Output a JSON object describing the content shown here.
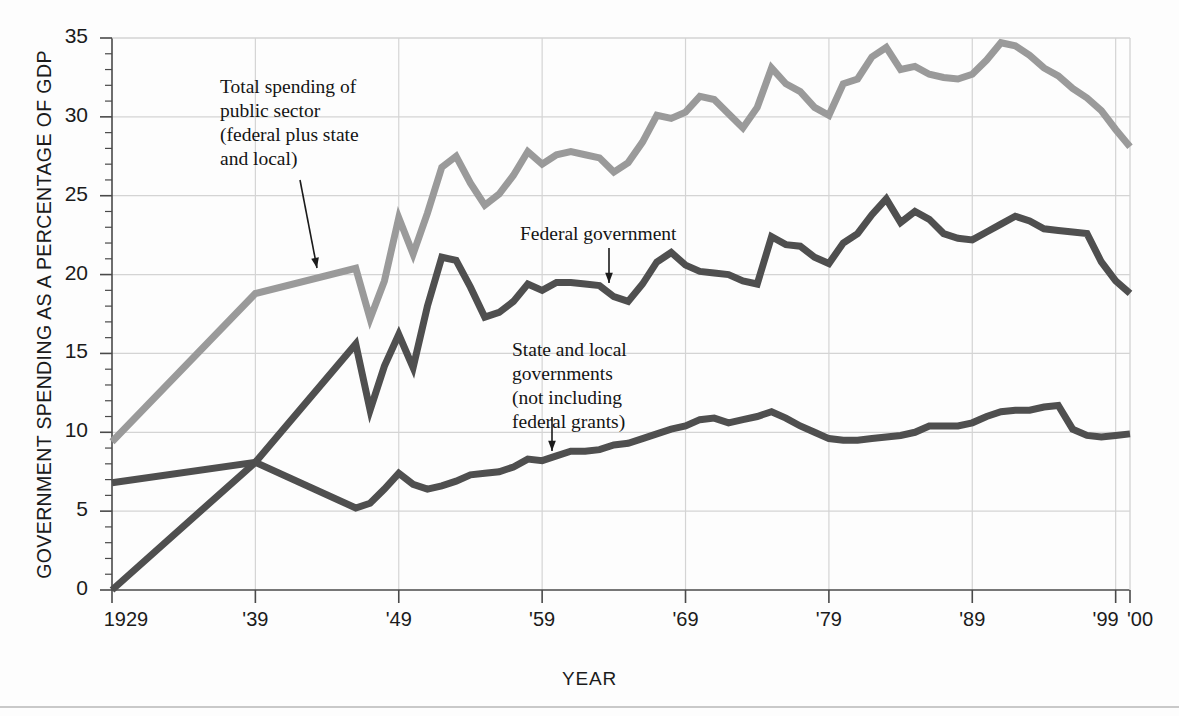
{
  "figure": {
    "background": "#fdfdfd",
    "x_axis_title": "YEAR",
    "y_axis_title": "GOVERNMENT SPENDING AS A PERCENTAGE OF GDP"
  },
  "annotations": {
    "total": "Total spending of\npublic sector\n(federal plus state\nand local)",
    "federal": "Federal government",
    "state": "State and local\ngovernments\n(not including\nfederal grants)"
  },
  "colors": {
    "total_line": "#9a9a9a",
    "federal_line": "#4f4f4f",
    "state_line": "#4f4f4f",
    "grid": "#d4d4d4",
    "axis": "#4a4a4a",
    "text": "#1b1b1b"
  },
  "chart_data": {
    "type": "line",
    "title": "",
    "xlabel": "YEAR",
    "ylabel": "GOVERNMENT SPENDING AS A PERCENTAGE OF GDP",
    "xlim": [
      1929,
      2000
    ],
    "ylim": [
      0,
      35
    ],
    "grid": true,
    "legend": "annotations on plot",
    "y_ticks_major": [
      0,
      5,
      10,
      15,
      20,
      25,
      30,
      35
    ],
    "y_tick_labels": [
      "0",
      "5",
      "10",
      "15",
      "20",
      "25",
      "30",
      "35"
    ],
    "y_tick_minor_step": 1,
    "x_ticks": [
      1929,
      1939,
      1949,
      1959,
      1969,
      1979,
      1989,
      1999,
      2000
    ],
    "x_tick_labels": [
      "1929",
      "'39",
      "'49",
      "'59",
      "'69",
      "'79",
      "'89",
      "'99",
      "'00"
    ],
    "x": [
      1929,
      1939,
      1946,
      1947,
      1948,
      1949,
      1950,
      1951,
      1952,
      1953,
      1954,
      1955,
      1956,
      1957,
      1958,
      1959,
      1960,
      1961,
      1962,
      1963,
      1964,
      1965,
      1966,
      1967,
      1968,
      1969,
      1970,
      1971,
      1972,
      1973,
      1974,
      1975,
      1976,
      1977,
      1978,
      1979,
      1980,
      1981,
      1982,
      1983,
      1984,
      1985,
      1986,
      1987,
      1988,
      1989,
      1990,
      1991,
      1992,
      1993,
      1994,
      1995,
      1996,
      1997,
      1998,
      1999,
      2000
    ],
    "series": [
      {
        "name": "Total spending of public sector (federal plus state and local)",
        "color": "#9a9a9a",
        "values": [
          9.4,
          18.8,
          20.4,
          17.2,
          19.6,
          23.6,
          21.3,
          23.9,
          26.8,
          27.5,
          25.8,
          24.4,
          25.1,
          26.3,
          27.8,
          27.0,
          27.6,
          27.8,
          27.6,
          27.4,
          26.5,
          27.1,
          28.4,
          30.1,
          29.9,
          30.3,
          31.3,
          31.1,
          30.2,
          29.3,
          30.6,
          33.1,
          32.1,
          31.6,
          30.6,
          30.1,
          32.1,
          32.4,
          33.8,
          34.4,
          33.0,
          33.2,
          32.7,
          32.5,
          32.4,
          32.7,
          33.6,
          34.7,
          34.5,
          33.9,
          33.1,
          32.6,
          31.8,
          31.2,
          30.4,
          29.2,
          28.1
        ]
      },
      {
        "name": "Federal government",
        "color": "#4f4f4f",
        "values": [
          0.0,
          8.1,
          15.6,
          11.4,
          14.2,
          16.2,
          14.1,
          18.0,
          21.1,
          20.9,
          19.2,
          17.3,
          17.6,
          18.3,
          19.4,
          19.0,
          19.5,
          19.5,
          19.4,
          19.3,
          18.6,
          18.3,
          19.4,
          20.8,
          21.4,
          20.6,
          20.2,
          20.1,
          20.0,
          19.6,
          19.4,
          22.4,
          21.9,
          21.8,
          21.1,
          20.7,
          22.0,
          22.6,
          23.8,
          24.8,
          23.3,
          24.0,
          23.5,
          22.6,
          22.3,
          22.2,
          22.7,
          23.2,
          23.7,
          23.4,
          22.9,
          22.8,
          22.7,
          22.6,
          20.8,
          19.6,
          18.8
        ]
      },
      {
        "name": "State and local governments (not including federal grants)",
        "color": "#4f4f4f",
        "values": [
          6.8,
          8.1,
          5.2,
          5.5,
          6.4,
          7.4,
          6.7,
          6.4,
          6.6,
          6.9,
          7.3,
          7.4,
          7.5,
          7.8,
          8.3,
          8.2,
          8.5,
          8.8,
          8.8,
          8.9,
          9.2,
          9.3,
          9.6,
          9.9,
          10.2,
          10.4,
          10.8,
          10.9,
          10.6,
          10.8,
          11.0,
          11.3,
          10.9,
          10.4,
          10.0,
          9.6,
          9.5,
          9.5,
          9.6,
          9.7,
          9.8,
          10.0,
          10.4,
          10.4,
          10.4,
          10.6,
          11.0,
          11.3,
          11.4,
          11.4,
          11.6,
          11.7,
          10.2,
          9.8,
          9.7,
          9.8,
          9.9
        ]
      }
    ]
  }
}
